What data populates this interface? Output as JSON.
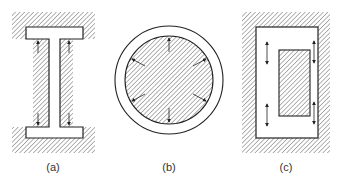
{
  "figure": {
    "panels": [
      {
        "id": "a",
        "label": "(a)",
        "shape": "I-section in hatched enclosure",
        "arrows": 4
      },
      {
        "id": "b",
        "label": "(b)",
        "shape": "hatched disc inside ring",
        "arrows": 6
      },
      {
        "id": "c",
        "label": "(c)",
        "shape": "hatched rectangle inside rectangular cavity",
        "arrows": 4
      }
    ],
    "colors": {
      "line": "#222222",
      "hatch": "#555555",
      "background": "#ffffff"
    }
  }
}
